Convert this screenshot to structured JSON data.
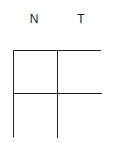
{
  "columns": [
    {
      "label": "N"
    },
    {
      "label": "T"
    }
  ],
  "grid": {
    "rows": 2,
    "cols": 2,
    "cells": [
      "",
      "",
      "",
      ""
    ],
    "line_color": "#222222"
  }
}
